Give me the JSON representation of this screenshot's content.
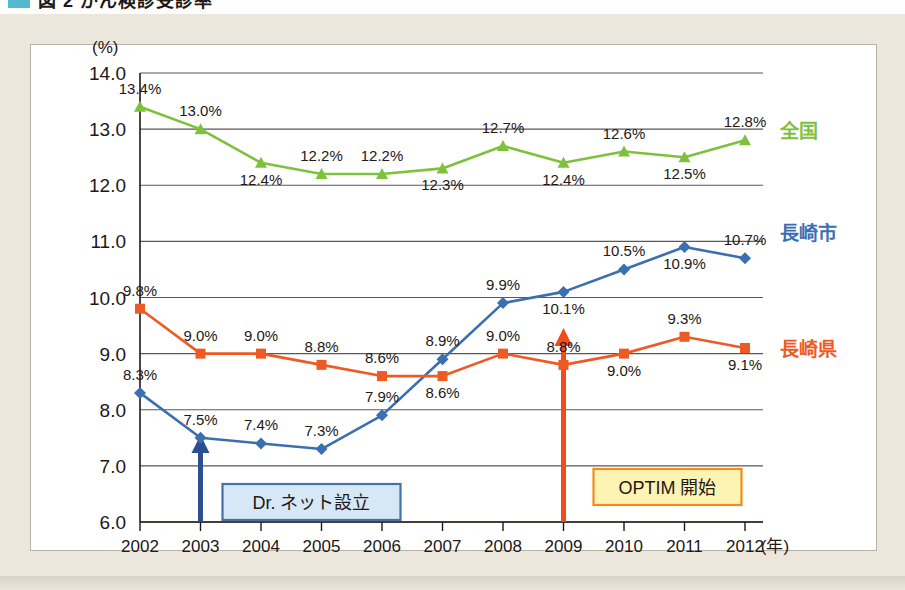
{
  "header": {
    "title_fragment": "図 2 がん検診受診率",
    "swatch_color": "#52b9cf"
  },
  "chart_data": {
    "type": "line",
    "title": "",
    "xlabel": "(年)",
    "ylabel": "(%)",
    "x": [
      2002,
      2003,
      2004,
      2005,
      2006,
      2007,
      2008,
      2009,
      2010,
      2011,
      2012
    ],
    "categories": [
      "2002",
      "2003",
      "2004",
      "2005",
      "2006",
      "2007",
      "2008",
      "2009",
      "2010",
      "2011",
      "2012"
    ],
    "ylim": [
      6.0,
      14.0
    ],
    "yticks": [
      "6.0",
      "7.0",
      "8.0",
      "9.0",
      "10.0",
      "11.0",
      "12.0",
      "13.0",
      "14.0"
    ],
    "ytick_values": [
      6.0,
      7.0,
      8.0,
      9.0,
      10.0,
      11.0,
      12.0,
      13.0,
      14.0
    ],
    "grid": true,
    "legend_position": "right",
    "series": [
      {
        "name": "全国",
        "color": "#7ec13d",
        "marker": "triangle",
        "values": [
          13.4,
          13.0,
          12.4,
          12.2,
          12.2,
          12.3,
          12.7,
          12.4,
          12.6,
          12.5,
          12.8
        ],
        "labels": [
          "13.4%",
          "13.0%",
          "12.4%",
          "12.2%",
          "12.2%",
          "12.3%",
          "12.7%",
          "12.4%",
          "12.6%",
          "12.5%",
          "12.8%"
        ],
        "label_side": [
          "above",
          "above",
          "below",
          "above",
          "above",
          "below",
          "above",
          "below",
          "above",
          "below",
          "above"
        ]
      },
      {
        "name": "長崎市",
        "color": "#3b6fb0",
        "marker": "diamond",
        "values": [
          8.3,
          7.5,
          7.4,
          7.3,
          7.9,
          8.9,
          9.9,
          10.1,
          10.5,
          10.9,
          10.7
        ],
        "labels": [
          "8.3%",
          "7.5%",
          "7.4%",
          "7.3%",
          "7.9%",
          "8.9%",
          "9.9%",
          "10.1%",
          "10.5%",
          "10.9%",
          "10.7%"
        ],
        "label_side": [
          "above",
          "above",
          "above",
          "above",
          "above",
          "above",
          "above",
          "below",
          "above",
          "below",
          "above"
        ]
      },
      {
        "name": "長崎県",
        "color": "#ee5a24",
        "marker": "square",
        "values": [
          9.8,
          9.0,
          9.0,
          8.8,
          8.6,
          8.6,
          9.0,
          8.8,
          9.0,
          9.3,
          9.1
        ],
        "labels": [
          "9.8%",
          "9.0%",
          "9.0%",
          "8.8%",
          "8.6%",
          "8.6%",
          "9.0%",
          "8.8%",
          "9.0%",
          "9.3%",
          "9.1%"
        ],
        "label_side": [
          "above",
          "above",
          "above",
          "above",
          "above",
          "below",
          "above",
          "above",
          "below",
          "above",
          "below"
        ]
      }
    ],
    "annotations": [
      {
        "text": "Dr. ネット設立",
        "year": 2003,
        "box_fill": "#d6e7f5",
        "box_border": "#4472a8",
        "arrow_color": "#2b4f91"
      },
      {
        "text": "OPTIM 開始",
        "year": 2009,
        "box_fill": "#fdf4b3",
        "box_border": "#f08c1e",
        "arrow_color": "#f24c1b"
      }
    ]
  }
}
